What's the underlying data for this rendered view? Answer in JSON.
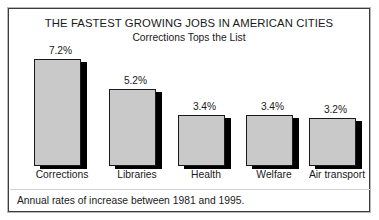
{
  "chart_data": {
    "type": "bar",
    "title": "THE FASTEST GROWING JOBS IN AMERICAN CITIES",
    "subtitle": "Corrections Tops the List",
    "footnote": "Annual rates of increase between 1981 and 1995.",
    "categories": [
      "Corrections",
      "Libraries",
      "Health",
      "Welfare",
      "Air transport"
    ],
    "values": [
      7.2,
      5.2,
      3.4,
      3.4,
      3.2
    ],
    "value_labels": [
      "7.2%",
      "5.2%",
      "3.4%",
      "3.4%",
      "3.2%"
    ],
    "xlabel": "",
    "ylabel": "",
    "ylim": [
      0,
      8
    ],
    "grid": false,
    "legend": false,
    "units": "percent per year",
    "bar_fill_color": "#c9c9c9",
    "bar_border_color": "#1a1a1a",
    "bar_shadow_color": "#000000",
    "text_color": "#1a1a1a",
    "background_color": "#ffffff",
    "frame_color": "#3c3c3c"
  }
}
